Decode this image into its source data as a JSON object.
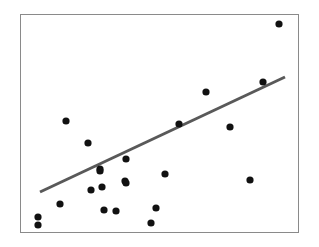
{
  "figure": {
    "width": 319,
    "height": 247,
    "background_color": "#ffffff"
  },
  "plot_frame": {
    "x": 20,
    "y": 14,
    "width": 279,
    "height": 219,
    "border_color": "#8a8a8a",
    "border_width": 1,
    "fill_color": "#ffffff"
  },
  "chart_data": {
    "type": "scatter",
    "title": "",
    "subtitle": "",
    "xlabel": "",
    "ylabel": "",
    "xlim": [
      0,
      1
    ],
    "ylim": [
      0,
      1
    ],
    "grid": false,
    "legend": null,
    "axis_ticks": false,
    "axis_tick_labels": [],
    "annotations": [],
    "marker": {
      "shape": "circle",
      "color": "#111111",
      "radius_px": 3.6,
      "count": 23
    },
    "points_px": [
      [
        279,
        24
      ],
      [
        263,
        82
      ],
      [
        206,
        92
      ],
      [
        66,
        121
      ],
      [
        179,
        124
      ],
      [
        230,
        127
      ],
      [
        88,
        143
      ],
      [
        126,
        159
      ],
      [
        100,
        169
      ],
      [
        125,
        181
      ],
      [
        165,
        174
      ],
      [
        91,
        190
      ],
      [
        102,
        187
      ],
      [
        60,
        204
      ],
      [
        104,
        210
      ],
      [
        116,
        211
      ],
      [
        156,
        208
      ],
      [
        151,
        223
      ],
      [
        38,
        217
      ],
      [
        38,
        225
      ],
      [
        250,
        180
      ],
      [
        100,
        171
      ],
      [
        126,
        183
      ]
    ],
    "points_normalized": [
      [
        0.928,
        0.954
      ],
      [
        0.871,
        0.689
      ],
      [
        0.667,
        0.644
      ],
      [
        0.165,
        0.511
      ],
      [
        0.57,
        0.498
      ],
      [
        0.753,
        0.484
      ],
      [
        0.244,
        0.411
      ],
      [
        0.38,
        0.338
      ],
      [
        0.287,
        0.292
      ],
      [
        0.376,
        0.237
      ],
      [
        0.52,
        0.269
      ],
      [
        0.254,
        0.196
      ],
      [
        0.294,
        0.21
      ],
      [
        0.143,
        0.132
      ],
      [
        0.301,
        0.105
      ],
      [
        0.344,
        0.1
      ],
      [
        0.487,
        0.114
      ],
      [
        0.47,
        0.046
      ],
      [
        0.065,
        0.073
      ],
      [
        0.065,
        0.037
      ],
      [
        0.824,
        0.242
      ],
      [
        0.287,
        0.283
      ],
      [
        0.38,
        0.228
      ]
    ],
    "trend_line": {
      "type": "linear-fit",
      "color": "#595959",
      "width_px": 3,
      "x1_px": 40,
      "y1_px": 192,
      "x2_px": 285,
      "y2_px": 77,
      "slope_px": -0.469,
      "description": "positive linear trend line"
    }
  }
}
